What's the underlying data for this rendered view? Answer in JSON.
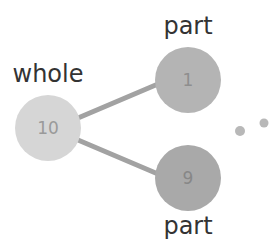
{
  "diagram": {
    "whole": {
      "label": "whole",
      "value": "10",
      "cx": 48,
      "cy": 128,
      "r": 33,
      "fill": "#d6d6d6",
      "text_color": "#9a9a9a"
    },
    "parts": [
      {
        "label": "part",
        "value": "1",
        "cx": 188,
        "cy": 80,
        "r": 33,
        "fill": "#b4b4b4",
        "text_color": "#8e8e8e"
      },
      {
        "label": "part",
        "value": "9",
        "cx": 188,
        "cy": 178,
        "r": 33,
        "fill": "#a9a9a9",
        "text_color": "#878787"
      }
    ],
    "line_color": "#a2a2a2",
    "dots": [
      {
        "cx": 240,
        "cy": 131,
        "r": 5,
        "fill": "#b8b8b8"
      },
      {
        "cx": 264,
        "cy": 123,
        "r": 4.5,
        "fill": "#b8b8b8"
      }
    ]
  }
}
